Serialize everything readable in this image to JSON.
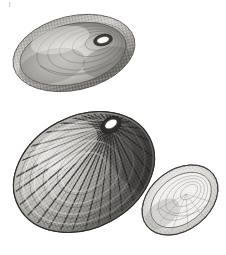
{
  "figure": {
    "kind": "natural-history-engraving",
    "background_color": "#ffffff",
    "ink_color": "#3a3a3a",
    "shadow_color": "#6e6e6e",
    "highlight_color": "#f2f2f2",
    "caption": "",
    "corner_mark": "",
    "specimens": [
      {
        "id": "upper-shell",
        "label": "interior view, oblique",
        "view": "interior",
        "center_x": 74,
        "center_y": 53,
        "radius_x": 62,
        "radius_y": 37,
        "rotation_deg": -13,
        "margin": "crenulated beaded rim",
        "aperture": {
          "cx": 103,
          "cy": 40,
          "rx": 9,
          "ry": 5,
          "rotation_deg": -14
        },
        "tone": "mid-grey with pale basin and soft concentric growth lines",
        "rib_count": 0,
        "bead_count": 64
      },
      {
        "id": "middle-shell",
        "label": "exterior view, radially ribbed",
        "view": "exterior",
        "center_x": 84,
        "center_y": 172,
        "radius_x": 74,
        "radius_y": 56,
        "rotation_deg": -28,
        "margin": "scalloped beaded rim",
        "aperture": {
          "cx": 111,
          "cy": 125,
          "rx": 10,
          "ry": 7,
          "rotation_deg": -30
        },
        "tone": "high-contrast, dark right flank, pale left flank",
        "rib_count": 44,
        "bead_count": 0
      },
      {
        "id": "lower-right-shell",
        "label": "interior view, tilted",
        "view": "interior",
        "center_x": 180,
        "center_y": 200,
        "radius_x": 42,
        "radius_y": 30,
        "rotation_deg": -38,
        "margin": "fine crenulated rim",
        "aperture": null,
        "tone": "pale, lightly shaded with faint muscle scar",
        "rib_count": 0,
        "bead_count": 40
      }
    ]
  }
}
